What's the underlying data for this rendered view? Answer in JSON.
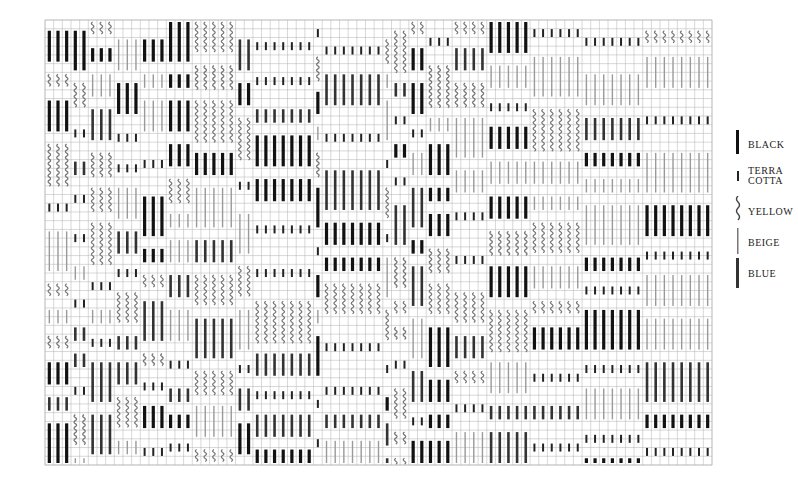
{
  "diagram": {
    "type": "weaving-draft",
    "grid": {
      "x0": 45,
      "y0": 20,
      "x1": 712,
      "y1": 465,
      "cols": 77,
      "rows": 51,
      "line_color": "#b0b0b0"
    },
    "colors": {
      "black": "#111111",
      "terracotta": "#222222",
      "yellow": "#777777",
      "beige": "#9a9a9a",
      "blue": "#333333"
    },
    "column_groups": [
      {
        "start": 0,
        "count": 3
      },
      {
        "start": 3,
        "count": 2
      },
      {
        "start": 5,
        "count": 3
      },
      {
        "start": 8,
        "count": 3
      },
      {
        "start": 11,
        "count": 3
      },
      {
        "start": 14,
        "count": 3
      },
      {
        "start": 17,
        "count": 5
      },
      {
        "start": 22,
        "count": 2
      },
      {
        "start": 24,
        "count": 7
      },
      {
        "start": 31,
        "count": 1
      },
      {
        "start": 32,
        "count": 7
      },
      {
        "start": 39,
        "count": 1
      },
      {
        "start": 40,
        "count": 2
      },
      {
        "start": 42,
        "count": 2
      },
      {
        "start": 44,
        "count": 3
      },
      {
        "start": 47,
        "count": 4
      },
      {
        "start": 51,
        "count": 5
      },
      {
        "start": 56,
        "count": 6
      },
      {
        "start": 62,
        "count": 7
      },
      {
        "start": 69,
        "count": 8
      }
    ]
  },
  "legend": {
    "items": [
      {
        "key": "black",
        "label": "BLACK",
        "symbol": "thick"
      },
      {
        "key": "terracotta",
        "label": "TERRA\nCOTTA",
        "symbol": "short"
      },
      {
        "key": "yellow",
        "label": "YELLOW",
        "symbol": "wavy"
      },
      {
        "key": "beige",
        "label": "BEIGE",
        "symbol": "thin"
      },
      {
        "key": "blue",
        "label": "BLUE",
        "symbol": "medium"
      }
    ]
  }
}
